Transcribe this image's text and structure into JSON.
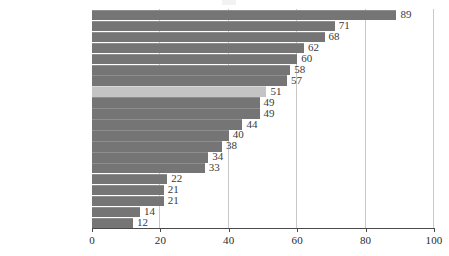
{
  "chart_data": {
    "type": "bar",
    "orientation": "horizontal",
    "title": "",
    "xlabel": "",
    "ylabel": "",
    "xlim": [
      0,
      100
    ],
    "xticks": [
      0,
      20,
      40,
      60,
      80,
      100
    ],
    "grid": true,
    "legend": false,
    "highlight_category": "BRASIL",
    "colors": {
      "bar": "#757575",
      "bar_highlight": "#c4c4c4",
      "gridline": "#c9c9c9",
      "axis": "#4a4a4a",
      "label_text": "#1a1a1a",
      "value_text": "#3a3a3a"
    },
    "categories": [
      "Haiti",
      "Guatemala",
      "Bolívia",
      "Nicarágua",
      "Honduras",
      "El Salvador",
      "Rep. Dominicana",
      "BRASIL",
      "Venezuela",
      "Peru",
      "Equador",
      "México",
      "Colômbia",
      "Paraguai",
      "Panamá",
      "Cuba",
      "Chile",
      "Costa Rica",
      "Uruguai",
      "Argentina"
    ],
    "values": [
      89,
      71,
      68,
      62,
      60,
      58,
      57,
      51,
      49,
      49,
      44,
      40,
      38,
      34,
      33,
      22,
      21,
      21,
      14,
      12
    ]
  }
}
